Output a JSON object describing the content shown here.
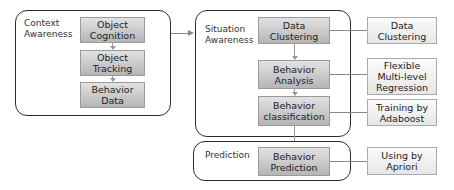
{
  "panels": {
    "context": {
      "label": "Context\nAwareness",
      "boxes": [
        "Object\nCognition",
        "Object\nTracking",
        "Behavior\nData"
      ]
    },
    "situation": {
      "label": "Situation\nAwareness",
      "boxes": [
        "Data\nClustering",
        "Behavior\nAnalysis",
        "Behavior\nclassification"
      ]
    },
    "prediction": {
      "label": "Prediction",
      "boxes": [
        "Behavior\nPrediction"
      ]
    }
  },
  "methods": [
    "Data\nClustering",
    "Flexible\nMulti-level\nRegression",
    "Training by\nAdaboost",
    "Using by\nApriori"
  ],
  "colors": {
    "panel_border": "#2b2b2b",
    "process_box_top": "#e2e2e2",
    "process_box_bottom": "#b5b5b5",
    "method_box": "#f0f0f0",
    "connector": "#888888"
  }
}
